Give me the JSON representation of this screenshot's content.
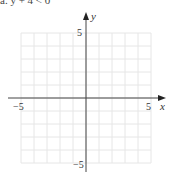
{
  "caption": "a. y + 4 < 0",
  "chart_data": {
    "type": "scatter",
    "title": "",
    "xlabel": "x",
    "ylabel": "y",
    "xlim": [
      -5,
      5
    ],
    "ylim": [
      -5,
      5
    ],
    "grid": true,
    "grid_step": 1,
    "x_tick_labels": [
      "-5",
      "5"
    ],
    "y_tick_labels": [
      "5",
      "-5"
    ],
    "series": [],
    "colors": {
      "grid": "#e6e6e6",
      "axis": "#444444",
      "text": "#333333"
    }
  }
}
